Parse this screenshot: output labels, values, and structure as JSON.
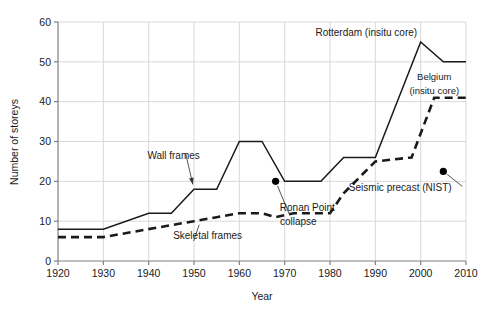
{
  "chart_data": {
    "type": "line",
    "title": "",
    "xlabel": "Year",
    "ylabel": "Number of storeys",
    "xlim": [
      1920,
      2010
    ],
    "ylim": [
      0,
      60
    ],
    "xticks": [
      1920,
      1930,
      1940,
      1950,
      1960,
      1970,
      1980,
      1990,
      2000,
      2010
    ],
    "yticks": [
      0,
      10,
      20,
      30,
      40,
      50,
      60
    ],
    "grid": true,
    "legend_position": "inline-annotations",
    "series": [
      {
        "name": "Wall frames",
        "style": "solid",
        "color": "#1a1a1a",
        "x": [
          1920,
          1930,
          1940,
          1945,
          1950,
          1955,
          1960,
          1965,
          1970,
          1975,
          1978,
          1983,
          1990,
          2000,
          2005,
          2010
        ],
        "values": [
          8,
          8,
          12,
          12,
          18,
          18,
          30,
          30,
          20,
          20,
          20,
          26,
          26,
          55,
          50,
          50
        ]
      },
      {
        "name": "Skeletal frames",
        "style": "dashed",
        "color": "#1a1a1a",
        "x": [
          1920,
          1930,
          1940,
          1950,
          1955,
          1960,
          1965,
          1968,
          1972,
          1980,
          1983,
          1990,
          1998,
          2003,
          2010
        ],
        "values": [
          6,
          6,
          8,
          10,
          11,
          12,
          12,
          11,
          12,
          12,
          17,
          25,
          26,
          41,
          41
        ]
      }
    ],
    "points": [
      {
        "name": "Ronan Point collapse",
        "x": 1968,
        "y": 20,
        "color": "#000000"
      },
      {
        "name": "Seismic precast (NIST)",
        "x": 2005,
        "y": 22.5,
        "color": "#000000"
      }
    ],
    "annotations": [
      {
        "id": "wall-frames",
        "text": "Wall frames",
        "text_x": 1945.5,
        "text_y": 25.5,
        "anchor": "middle",
        "target_x": 1950,
        "target_y": 18
      },
      {
        "id": "skeletal-frames",
        "text": "Skeletal frames",
        "text_x": 1953,
        "text_y": 5.5,
        "anchor": "middle",
        "target_x": 1951.5,
        "target_y": 10.3
      },
      {
        "id": "rotterdam",
        "text": "Rotterdam (insitu core)",
        "text_x": 1988,
        "text_y": 56.5,
        "anchor": "middle",
        "target_x": null,
        "target_y": null
      },
      {
        "id": "belgium-line1",
        "text": "Belgium",
        "text_x": 2003,
        "text_y": 45.5,
        "anchor": "middle",
        "target_x": null,
        "target_y": null
      },
      {
        "id": "belgium-line2",
        "text": "(insitu core)",
        "text_x": 2003,
        "text_y": 42.0,
        "anchor": "middle",
        "target_x": null,
        "target_y": null
      },
      {
        "id": "ronan-point-line1",
        "text": "Ronan Point",
        "text_x": 1975,
        "text_y": 12.5,
        "anchor": "middle",
        "target_x": 1968,
        "target_y": 20
      },
      {
        "id": "ronan-point-line2",
        "text": "collapse",
        "text_x": 1973,
        "text_y": 9.0,
        "anchor": "middle",
        "target_x": null,
        "target_y": null
      },
      {
        "id": "seismic-precast-nist",
        "text": "Seismic precast (NIST)",
        "text_x": 1995.5,
        "text_y": 17.5,
        "anchor": "middle",
        "target_x": 2005,
        "target_y": 22.5
      }
    ]
  },
  "colors": {
    "line": "#1a1a1a",
    "grid": "#d8d8d8",
    "axis": "#808080",
    "text": "#1a1a1a",
    "point": "#000000",
    "background": "#ffffff"
  }
}
